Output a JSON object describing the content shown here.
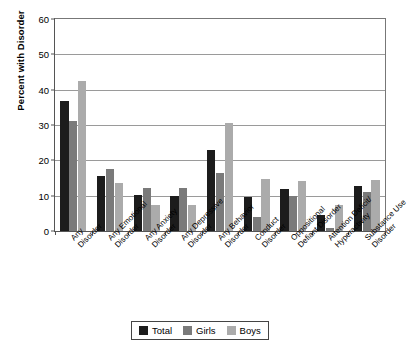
{
  "chart_data": {
    "type": "bar",
    "title": "",
    "subtitle": "",
    "xlabel": "",
    "ylabel": "Percent with Disorder",
    "ylim": [
      0,
      60
    ],
    "yticks": [
      0,
      10,
      20,
      30,
      40,
      50,
      60
    ],
    "ytick_labels": [
      "0",
      "10",
      "20",
      "30",
      "40",
      "50",
      "60"
    ],
    "grid": "horizontal",
    "legend_position": "bottom-center",
    "categories": [
      "Any\nDisorder",
      "Any Emotional\nDisorder",
      "Any Anxiety\nDisorder",
      "Any Depressive\nDisorder",
      "Any Behavior\nDisorder",
      "Conduct\nDisorder",
      "Oppositional\nDefiant Disorder",
      "Attention Deficit/\nHyperactivity",
      "Substance Use\nDisorder"
    ],
    "category_lines": [
      [
        "Any",
        "Disorder"
      ],
      [
        "Any Emotional",
        "Disorder"
      ],
      [
        "Any Anxiety",
        "Disorder"
      ],
      [
        "Any Depressive",
        "Disorder"
      ],
      [
        "Any Behavior",
        "Disorder"
      ],
      [
        "Conduct",
        "Disorder"
      ],
      [
        "Oppositional",
        "Defiant Disorder"
      ],
      [
        "Attention Deficit/",
        "Hyperactivity"
      ],
      [
        "Substance Use",
        "Disorder"
      ]
    ],
    "series": [
      {
        "name": "Total",
        "color": "#1c1c1c",
        "values": [
          36.7,
          15.5,
          10.2,
          10.0,
          23.0,
          9.5,
          12.0,
          4.5,
          12.7
        ]
      },
      {
        "name": "Girls",
        "color": "#7a7a7a",
        "values": [
          31.0,
          17.5,
          12.2,
          12.2,
          16.3,
          4.0,
          10.0,
          0.8,
          11.0
        ]
      },
      {
        "name": "Boys",
        "color": "#ababab",
        "values": [
          42.5,
          13.5,
          7.5,
          7.4,
          30.5,
          14.8,
          14.2,
          7.5,
          14.5
        ]
      }
    ]
  },
  "legend": {
    "items": [
      {
        "label": "Total",
        "color": "#1c1c1c"
      },
      {
        "label": "Girls",
        "color": "#7a7a7a"
      },
      {
        "label": "Boys",
        "color": "#ababab"
      }
    ]
  },
  "axis": {
    "y_title": "Percent with Disorder"
  }
}
